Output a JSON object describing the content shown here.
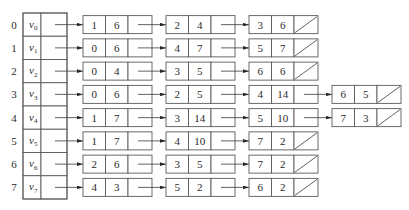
{
  "diagram": {
    "type": "adjacency-list",
    "colors": {
      "line": "#3a3a3a",
      "box_border": "#5a5a5a",
      "text": "#2a2a2a",
      "background": "#ffffff"
    },
    "vertices": [
      {
        "index": "0",
        "label": "v",
        "sub": "0",
        "edges": [
          {
            "adjvex": "1",
            "weight": "6"
          },
          {
            "adjvex": "2",
            "weight": "4"
          },
          {
            "adjvex": "3",
            "weight": "6"
          }
        ]
      },
      {
        "index": "1",
        "label": "v",
        "sub": "1",
        "edges": [
          {
            "adjvex": "0",
            "weight": "6"
          },
          {
            "adjvex": "4",
            "weight": "7"
          },
          {
            "adjvex": "5",
            "weight": "7"
          }
        ]
      },
      {
        "index": "2",
        "label": "v",
        "sub": "2",
        "edges": [
          {
            "adjvex": "0",
            "weight": "4"
          },
          {
            "adjvex": "3",
            "weight": "5"
          },
          {
            "adjvex": "6",
            "weight": "6"
          }
        ]
      },
      {
        "index": "3",
        "label": "v",
        "sub": "3",
        "edges": [
          {
            "adjvex": "0",
            "weight": "6"
          },
          {
            "adjvex": "2",
            "weight": "5"
          },
          {
            "adjvex": "4",
            "weight": "14"
          },
          {
            "adjvex": "6",
            "weight": "5"
          }
        ]
      },
      {
        "index": "4",
        "label": "v",
        "sub": "4",
        "edges": [
          {
            "adjvex": "1",
            "weight": "7"
          },
          {
            "adjvex": "3",
            "weight": "14"
          },
          {
            "adjvex": "5",
            "weight": "10"
          },
          {
            "adjvex": "7",
            "weight": "3"
          }
        ]
      },
      {
        "index": "5",
        "label": "v",
        "sub": "5",
        "edges": [
          {
            "adjvex": "1",
            "weight": "7"
          },
          {
            "adjvex": "4",
            "weight": "10"
          },
          {
            "adjvex": "7",
            "weight": "2"
          }
        ]
      },
      {
        "index": "6",
        "label": "v",
        "sub": "6",
        "edges": [
          {
            "adjvex": "2",
            "weight": "6"
          },
          {
            "adjvex": "3",
            "weight": "5"
          },
          {
            "adjvex": "7",
            "weight": "2"
          }
        ]
      },
      {
        "index": "7",
        "label": "v",
        "sub": "7",
        "edges": [
          {
            "adjvex": "4",
            "weight": "3"
          },
          {
            "adjvex": "5",
            "weight": "2"
          },
          {
            "adjvex": "6",
            "weight": "2"
          }
        ]
      }
    ]
  }
}
